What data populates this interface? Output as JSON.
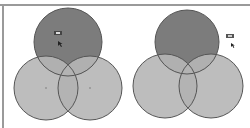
{
  "diagrams": [
    {
      "id": "left",
      "type": "venn-3",
      "highlight": "top circle (A), cursor hovering over it",
      "colors": {
        "base": "#bdbdbd",
        "highlight": "#7c7c7c",
        "stroke": "#555555",
        "overlap": "#acacac"
      },
      "circles": [
        {
          "name": "top",
          "cx": 68,
          "cy": 42,
          "r": 34
        },
        {
          "name": "bottom-left",
          "cx": 46,
          "cy": 88,
          "r": 32
        },
        {
          "name": "bottom-right",
          "cx": 90,
          "cy": 88,
          "r": 32
        }
      ],
      "center_dots": [
        {
          "x": 46,
          "y": 88
        },
        {
          "x": 90,
          "y": 88
        }
      ],
      "cursor": {
        "x": 58,
        "y": 42
      },
      "tooltip_badge": {
        "x": 55,
        "y": 31
      }
    },
    {
      "id": "right",
      "type": "venn-3",
      "highlight": "top circle (A)",
      "colors": {
        "base": "#bdbdbd",
        "highlight": "#7c7c7c",
        "stroke": "#555555",
        "overlap": "#acacac"
      },
      "circles": [
        {
          "name": "top",
          "cx": 187,
          "cy": 42,
          "r": 32
        },
        {
          "name": "bottom-left",
          "cx": 165,
          "cy": 86,
          "r": 32
        },
        {
          "name": "bottom-right",
          "cx": 211,
          "cy": 86,
          "r": 32
        }
      ],
      "cursor": {
        "x": 232,
        "y": 44
      },
      "tooltip_badge": {
        "x": 227,
        "y": 34
      }
    }
  ]
}
